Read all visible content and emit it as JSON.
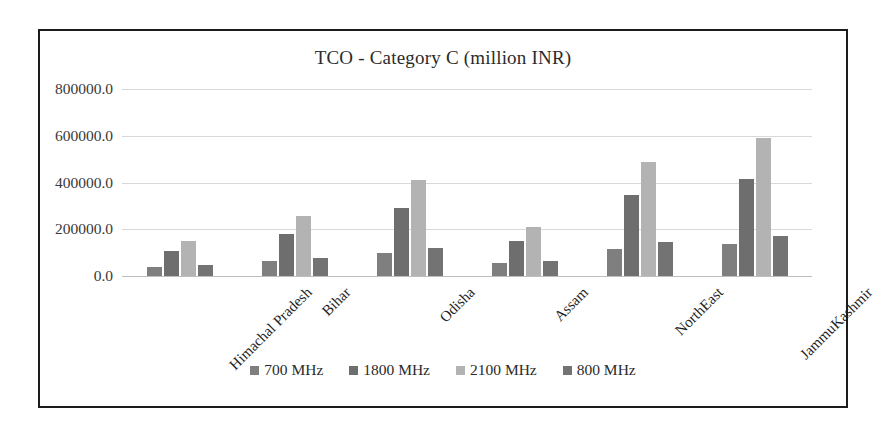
{
  "chart_data": {
    "type": "bar",
    "title": "TCO - Category C (million INR)",
    "xlabel": "",
    "ylabel": "",
    "ylim": [
      0,
      800000
    ],
    "ytick_labels": [
      "0.0",
      "200000.0",
      "400000.0",
      "600000.0",
      "800000.0"
    ],
    "ytick_values": [
      0,
      200000,
      400000,
      600000,
      800000
    ],
    "grid": true,
    "legend_position": "bottom",
    "categories": [
      "Himachal Pradesh",
      "Bihar",
      "Odisha",
      "Assam",
      "NorthEast",
      "JammuKashmir"
    ],
    "series": [
      {
        "name": "700 MHz",
        "color": "#7f7f7f",
        "values": [
          38000,
          65000,
          98000,
          55000,
          115000,
          135000
        ]
      },
      {
        "name": "1800 MHz",
        "color": "#6e6e6e",
        "values": [
          108000,
          180000,
          290000,
          148000,
          345000,
          415000
        ]
      },
      {
        "name": "2100 MHz",
        "color": "#b3b3b3",
        "values": [
          150000,
          255000,
          412000,
          210000,
          487000,
          590000
        ]
      },
      {
        "name": "800 MHz",
        "color": "#737373",
        "values": [
          48000,
          78000,
          120000,
          63000,
          145000,
          172000
        ]
      }
    ]
  },
  "frame": {
    "border_color": "#1c1c1c"
  }
}
